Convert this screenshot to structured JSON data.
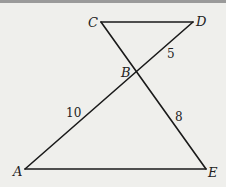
{
  "figure": {
    "type": "geometry",
    "points": [
      {
        "name": "A",
        "label": "A"
      },
      {
        "name": "B",
        "label": "B"
      },
      {
        "name": "C",
        "label": "C"
      },
      {
        "name": "D",
        "label": "D"
      },
      {
        "name": "E",
        "label": "E"
      }
    ],
    "segments": [
      {
        "from": "C",
        "to": "D"
      },
      {
        "from": "C",
        "to": "E"
      },
      {
        "from": "A",
        "to": "D"
      },
      {
        "from": "A",
        "to": "E"
      }
    ],
    "lengths": [
      {
        "segment": "BD",
        "label": "5"
      },
      {
        "segment": "AB",
        "label": "10"
      },
      {
        "segment": "BE",
        "label": "8"
      }
    ]
  }
}
